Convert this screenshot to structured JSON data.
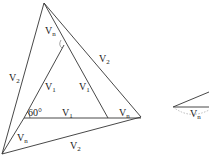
{
  "diagram": {
    "labels": {
      "vn_top": "V",
      "vn_top_sub": "n",
      "v2_left": "V",
      "v2_left_sub": "2",
      "v2_right": "V",
      "v2_right_sub": "2",
      "v1_left": "V",
      "v1_left_sub": "1",
      "v1_mid": "V",
      "v1_mid_sub": "1",
      "v1_base": "V",
      "v1_base_sub": "1",
      "angle": "60°",
      "vn_right": "V",
      "vn_right_sub": "n",
      "vn_left": "V",
      "vn_left_sub": "n",
      "v2_bottom": "V",
      "v2_bottom_sub": "2",
      "vn_small": "V",
      "vn_small_sub": "n"
    },
    "colors": {
      "line": "#333333",
      "dotted": "#999999"
    }
  }
}
